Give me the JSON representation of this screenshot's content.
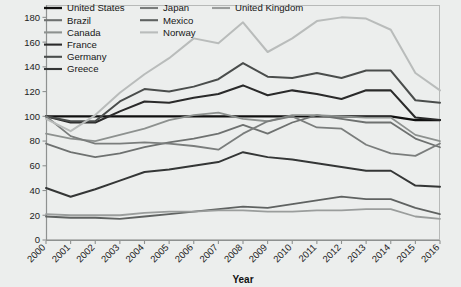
{
  "chart_data": {
    "type": "line",
    "title": "",
    "xlabel": "Year",
    "ylabel": "",
    "grid": false,
    "legend_position": "top-left-inside",
    "xlim": [
      2000,
      2016
    ],
    "ylim": [
      0,
      190
    ],
    "yticks": [
      0,
      20,
      40,
      60,
      80,
      100,
      120,
      140,
      160,
      180
    ],
    "ytick_labels": [
      "0",
      "20",
      "40",
      "60",
      "80",
      "100",
      "120",
      "140",
      "160",
      "180"
    ],
    "x": [
      2000,
      2001,
      2002,
      2003,
      2004,
      2005,
      2006,
      2007,
      2008,
      2009,
      2010,
      2011,
      2012,
      2013,
      2014,
      2015,
      2016
    ],
    "xtick_labels": [
      "2000",
      "2001",
      "2002",
      "2003",
      "2004",
      "2005",
      "2006",
      "2007",
      "2008",
      "2009",
      "2010",
      "2011",
      "2012",
      "2013",
      "2014",
      "2015",
      "2016"
    ],
    "series": [
      {
        "name": "United States",
        "color": "#101010",
        "width": 2.3,
        "values": [
          100,
          100,
          100,
          100,
          100,
          100,
          100,
          100,
          100,
          100,
          100,
          100,
          100,
          100,
          100,
          97,
          97
        ]
      },
      {
        "name": "Brazil",
        "color": "#6e7170",
        "width": 1.8,
        "values": [
          78,
          71,
          67,
          70,
          75,
          79,
          82,
          86,
          93,
          86,
          95,
          101,
          98,
          95,
          95,
          82,
          75
        ]
      },
      {
        "name": "Canada",
        "color": "#8d918f",
        "width": 1.8,
        "values": [
          86,
          82,
          80,
          85,
          90,
          97,
          101,
          103,
          98,
          96,
          101,
          101,
          100,
          99,
          99,
          85,
          80
        ]
      },
      {
        "name": "France",
        "color": "#2a2a2a",
        "width": 2.1,
        "values": [
          100,
          95,
          95,
          104,
          112,
          111,
          115,
          118,
          125,
          117,
          121,
          118,
          114,
          121,
          121,
          99,
          97
        ]
      },
      {
        "name": "Germany",
        "color": "#4a4d4c",
        "width": 2.0,
        "values": [
          100,
          96,
          96,
          112,
          122,
          120,
          124,
          130,
          143,
          132,
          131,
          135,
          131,
          137,
          137,
          113,
          111
        ]
      },
      {
        "name": "Greece",
        "color": "#343636",
        "width": 2.0,
        "values": [
          42,
          35,
          41,
          48,
          55,
          57,
          60,
          63,
          71,
          67,
          65,
          62,
          59,
          56,
          56,
          44,
          43
        ]
      },
      {
        "name": "Japan",
        "color": "#7a7d7c",
        "width": 1.8,
        "values": [
          100,
          84,
          78,
          78,
          79,
          78,
          76,
          73,
          86,
          96,
          100,
          91,
          90,
          77,
          70,
          68,
          78
        ]
      },
      {
        "name": "Mexico",
        "color": "#5f6261",
        "width": 1.8,
        "values": [
          19,
          18,
          18,
          17,
          19,
          21,
          23,
          25,
          27,
          26,
          29,
          32,
          35,
          33,
          33,
          26,
          21
        ]
      },
      {
        "name": "Norway",
        "color": "#b9bcbb",
        "width": 2.0,
        "values": [
          98,
          88,
          101,
          119,
          134,
          147,
          163,
          159,
          176,
          152,
          163,
          177,
          180,
          179,
          170,
          135,
          121
        ]
      },
      {
        "name": "United Kingdom",
        "color": "#9a9d9c",
        "width": 1.8,
        "values": [
          21,
          20,
          20,
          20,
          22,
          23,
          23,
          24,
          24,
          23,
          23,
          24,
          24,
          25,
          25,
          19,
          17
        ]
      }
    ],
    "legend_columns": [
      [
        "United States",
        "Brazil",
        "Canada",
        "France",
        "Germany",
        "Greece"
      ],
      [
        "Japan",
        "Mexico",
        "Norway"
      ],
      [
        "United Kingdom"
      ]
    ]
  },
  "axis": {
    "x_title": "Year"
  }
}
